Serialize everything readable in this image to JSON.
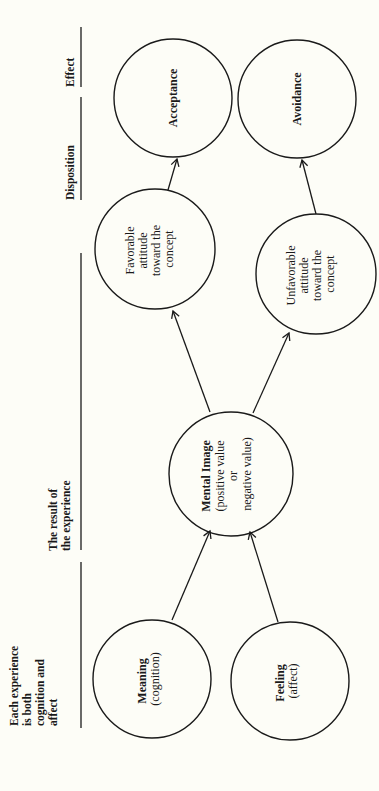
{
  "diagram": {
    "orientation": "rotated 90° counter-clockwise (text reads bottom-to-top)",
    "background": "#fdfdf7",
    "stroke_color": "#1a1a1a",
    "headers": [
      {
        "id": "experience",
        "lines": [
          "Each experience",
          "is both",
          "cognition and",
          "affect"
        ]
      },
      {
        "id": "result",
        "lines": [
          "The result of",
          "the experience"
        ]
      },
      {
        "id": "disposition",
        "lines": [
          "Disposition"
        ]
      },
      {
        "id": "effect",
        "lines": [
          "Effect"
        ]
      }
    ],
    "nodes": {
      "meaning": {
        "title": "Meaning",
        "subtitle": "(cognition)"
      },
      "feeling": {
        "title": "Feeling",
        "subtitle": "(affect)"
      },
      "mental_image": {
        "title": "Mental Image",
        "lines": [
          "(positive value",
          "or",
          "negative value)"
        ]
      },
      "favorable": {
        "lines": [
          "Favorable",
          "attitude",
          "toward the",
          "concept"
        ]
      },
      "unfavorable": {
        "lines": [
          "Unfavorable",
          "attitude",
          "toward the",
          "concept"
        ]
      },
      "acceptance": {
        "title": "Acceptance"
      },
      "avoidance": {
        "title": "Avoidance"
      }
    },
    "edges": [
      {
        "from": "Meaning",
        "to": "Mental Image"
      },
      {
        "from": "Feeling",
        "to": "Mental Image"
      },
      {
        "from": "Mental Image",
        "to": "Favorable attitude toward the concept"
      },
      {
        "from": "Mental Image",
        "to": "Unfavorable attitude toward the concept"
      },
      {
        "from": "Favorable attitude toward the concept",
        "to": "Acceptance"
      },
      {
        "from": "Unfavorable attitude toward the concept",
        "to": "Avoidance"
      }
    ]
  }
}
